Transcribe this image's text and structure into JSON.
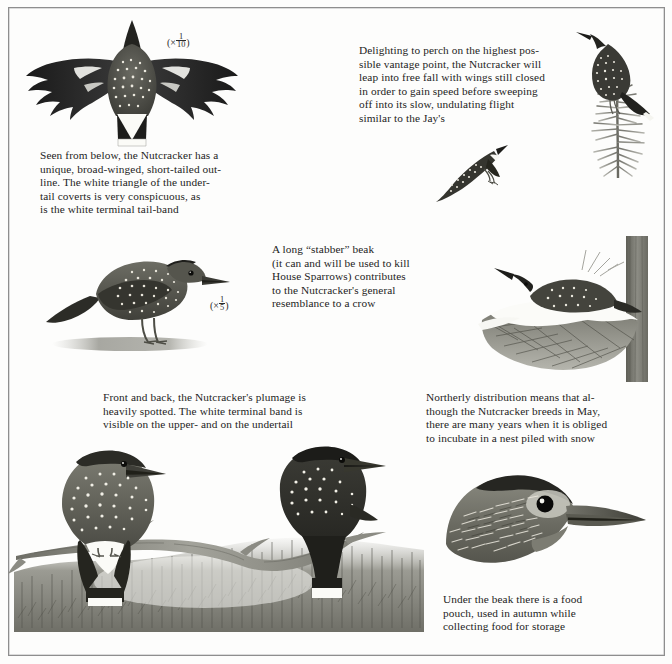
{
  "page": {
    "subject": "Nutcracker",
    "border_color": "#8e8e8e",
    "background_color": "#fdfdfc",
    "ink_color": "#1d1d1d"
  },
  "scales": [
    {
      "id": "scale-tenth",
      "prefix": "(×",
      "numerator": "1",
      "denominator": "10",
      "suffix": ")"
    },
    {
      "id": "scale-fifth",
      "prefix": "(×",
      "numerator": "1",
      "denominator": "5",
      "suffix": ")"
    }
  ],
  "captions": {
    "underside": "Seen from below, the Nutcracker has a\nunique, broad-winged, short-tailed out-\nline. The white triangle of the under-\ntail coverts is very conspicuous, as\nis the white terminal tail-band",
    "perching": "Delighting to perch on the highest pos-\nsible vantage point, the Nutcracker will\nleap into free fall with wings still closed\nin order to gain speed before sweeping\noff into its slow, undulating flight\nsimilar to the Jay's",
    "beak": "A long “stabber” beak\n(it can and will be used to kill\nHouse Sparrows) contributes\nto the Nutcracker's general\nresemblance to a crow",
    "plumage": "Front and back, the Nutcracker's plumage is\nheavily spotted. The white terminal band is\nvisible on the upper- and on the undertail",
    "breeding": "Northerly distribution means that al-\nthough the Nutcracker breeds in May,\nthere are many years when it is obliged\nto incubate in a nest piled with snow",
    "pouch": "Under the beak there is a food\npouch, used in autumn while\ncollecting food for storage"
  },
  "figures": [
    {
      "id": "fig-spread",
      "name": "nutcracker-in-flight-from-below",
      "description": "Nutcracker seen from below with wings fully spread and short tail"
    },
    {
      "id": "fig-perched",
      "name": "nutcracker-perched-on-spruce-top",
      "description": "Nutcracker perched on the top of a spruce sprig"
    },
    {
      "id": "fig-diving",
      "name": "nutcracker-diving-wings-closed",
      "description": "Nutcracker leaping into free fall with wings still closed"
    },
    {
      "id": "fig-standing",
      "name": "nutcracker-standing-profile",
      "description": "Nutcracker standing in profile on the ground"
    },
    {
      "id": "fig-nest",
      "name": "nutcracker-on-snowy-nest",
      "description": "Nutcracker incubating in a nest piled with snow beside a tree trunk"
    },
    {
      "id": "fig-branch",
      "name": "nutcracker-pair-on-branch",
      "description": "Two Nutcrackers on a branch, front and back views, above a conifer forest"
    },
    {
      "id": "fig-head",
      "name": "nutcracker-head-close-up",
      "description": "Close-up of Nutcracker head showing the long beak and food pouch"
    }
  ]
}
